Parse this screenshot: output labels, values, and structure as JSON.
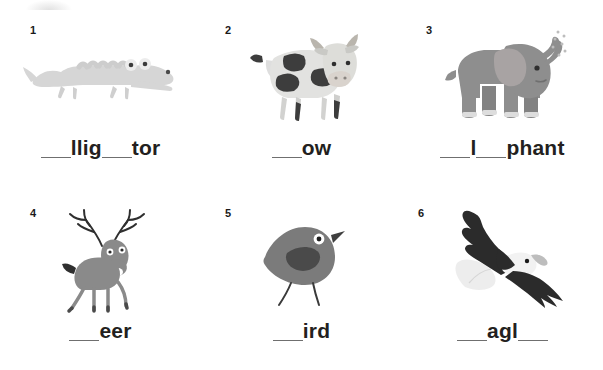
{
  "worksheet": {
    "title": "Fill in the missing letters - animals",
    "background_color": "#ffffff",
    "text_color": "#231f20",
    "blank_line_color": "#6f6f6f",
    "items": [
      {
        "number": "1",
        "animal": "alligator",
        "icon_name": "alligator-illustration",
        "answer": "alligator",
        "word_parts": [
          {
            "type": "blank"
          },
          {
            "type": "letters",
            "text": "llig"
          },
          {
            "type": "blank"
          },
          {
            "type": "letters",
            "text": "tor"
          }
        ],
        "display_word": "___llig___tor",
        "colors": {
          "body": "#d6d6d6",
          "shade": "#c8c8c8",
          "eye": "#ffffff",
          "pupil": "#3b3b3b"
        }
      },
      {
        "number": "2",
        "animal": "cow",
        "icon_name": "cow-illustration",
        "answer": "cow",
        "word_parts": [
          {
            "type": "blank"
          },
          {
            "type": "letters",
            "text": "ow"
          }
        ],
        "display_word": "___ow",
        "colors": {
          "body": "#e2e2e0",
          "spots": "#3d3d3d",
          "shade": "#c9c9c7",
          "horn": "#b9b5ad",
          "muzzle": "#d8d2cc"
        }
      },
      {
        "number": "3",
        "animal": "elephant",
        "icon_name": "elephant-illustration",
        "answer": "elephant",
        "word_parts": [
          {
            "type": "blank"
          },
          {
            "type": "letters",
            "text": "l"
          },
          {
            "type": "blank"
          },
          {
            "type": "letters",
            "text": "phant"
          }
        ],
        "display_word": "___l___phant",
        "colors": {
          "body": "#8e8e8e",
          "ear": "#a8a3a3",
          "tusk": "#e8e8e8",
          "spray": "#c2c2c2",
          "eye": "#3b3b3b"
        }
      },
      {
        "number": "4",
        "animal": "deer",
        "icon_name": "deer-illustration",
        "answer": "deer",
        "word_parts": [
          {
            "type": "blank"
          },
          {
            "type": "letters",
            "text": "eer"
          }
        ],
        "display_word": "___eer",
        "colors": {
          "body": "#8a8a8a",
          "antler": "#2f2f2f",
          "tail": "#2f2f2f",
          "eye": "#ffffff",
          "pupil": "#2b2b2b"
        }
      },
      {
        "number": "5",
        "animal": "bird",
        "icon_name": "bird-illustration",
        "answer": "bird",
        "word_parts": [
          {
            "type": "blank"
          },
          {
            "type": "letters",
            "text": "ird"
          }
        ],
        "display_word": "___ird",
        "colors": {
          "body": "#7b7b7b",
          "wing": "#4a4a4a",
          "eye": "#ffffff",
          "pupil": "#1f1f1f",
          "beak": "#3f3f3f",
          "legs": "#3a3a3a"
        }
      },
      {
        "number": "6",
        "animal": "eagle",
        "icon_name": "eagle-illustration",
        "answer": "eagle",
        "word_parts": [
          {
            "type": "blank"
          },
          {
            "type": "letters",
            "text": "agl"
          },
          {
            "type": "blank"
          }
        ],
        "display_word": "___agl___",
        "colors": {
          "body": "#2b2b2b",
          "head": "#f2f2f2",
          "tail": "#ededed",
          "beak": "#bdbdbd",
          "eye": "#1a1a1a"
        }
      }
    ]
  }
}
